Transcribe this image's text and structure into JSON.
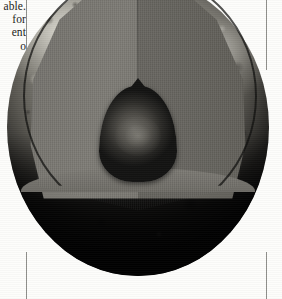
{
  "page": {
    "width": 282,
    "height": 299,
    "background_color": "#fdfdfb"
  },
  "column_text": {
    "name": "clipped-column-text",
    "note": "Body-copy fragment clipped by the left page edge; only line endings are visible.",
    "lines": [
      "able.",
      "for",
      "ent",
      "o"
    ]
  },
  "column_rules": {
    "left_top": "vertical-rule",
    "left_bottom": "vertical-rule",
    "right_top": "vertical-rule",
    "right_bottom": "vertical-rule",
    "color": "#8e8e8a"
  },
  "figure": {
    "name": "planet-cutaway-diagram",
    "type": "cutaway-sphere",
    "layers": [
      {
        "name": "crust",
        "label": "",
        "color": "#9a988f",
        "description": "Mottled outer surface, bright upper-left limb fading to deep shadow at the bottom."
      },
      {
        "name": "mantle-left-face",
        "label": "",
        "color": "#7d7b75",
        "description": "Lit left cut face of the removed wedge."
      },
      {
        "name": "mantle-right-face",
        "label": "",
        "color": "#67655f",
        "description": "Shadowed right cut face of the removed wedge."
      },
      {
        "name": "mantle-floor",
        "label": "",
        "color": "#6e6c66",
        "description": "Elliptical shelf at the base of the cutaway."
      },
      {
        "name": "inner-core",
        "label": "",
        "color": "#2c2b28",
        "description": "Dark pointed dome at the centre of the sphere."
      }
    ],
    "colors": {
      "crust_highlight": "#e1dfd6",
      "crust_midtone": "#9a988f",
      "crust_shadow": "#09090a",
      "mantle_light": "#7d7b75",
      "mantle_dark": "#4e4c47",
      "core_highlight": "#6a6862",
      "core_shadow": "#131312",
      "rule": "#8e8e8a"
    }
  }
}
